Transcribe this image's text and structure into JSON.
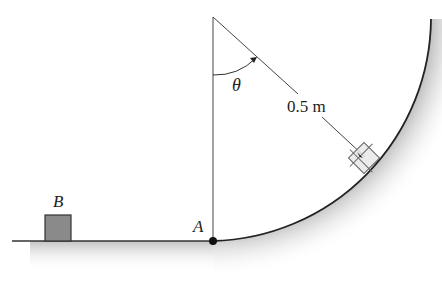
{
  "diagram": {
    "labels": {
      "block_b": "B",
      "point_a": "A",
      "angle": "θ",
      "radius": "0.5 m"
    },
    "colors": {
      "line": "#333333",
      "block_fill": "#8a8a8a",
      "ground_shade": "#c8c8c8"
    }
  }
}
